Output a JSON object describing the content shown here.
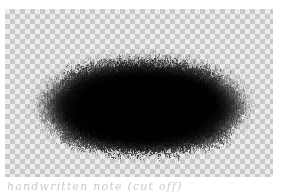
{
  "page": {
    "background_color": "#ffffff",
    "width": 285,
    "height": 192
  },
  "canvas": {
    "label": "transparent-canvas",
    "x": 5,
    "y": 9,
    "width": 268,
    "height": 168,
    "checker_size_px": 5,
    "checker_light_color": "#ececec",
    "checker_dark_color": "#c9c9c9"
  },
  "artwork": {
    "name": "charcoal-smudge",
    "description": "Dark charcoal / soft-pencil brush smudge, lens-shaped cloud with scratchy feathered edges",
    "ink_color": "#000000",
    "center_x": 138,
    "center_y": 96,
    "radius_x": 107,
    "radius_y": 50,
    "opacity": 0.97
  },
  "annotation": {
    "text": "handwritten note (cut off)",
    "color": "#b9b9b9"
  }
}
